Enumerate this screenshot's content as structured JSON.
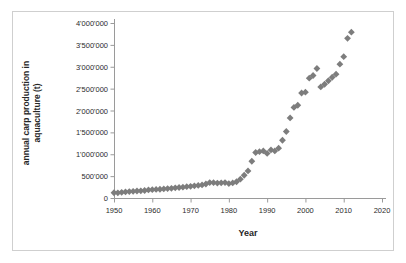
{
  "figure": {
    "background_color": "#ffffff",
    "frame_color": "#cfcfcf",
    "axis_color": "#9a9a9a",
    "marker_color": "#7d7d7d",
    "text_color": "#2b2b2b"
  },
  "chart_data": {
    "type": "scatter",
    "title": "",
    "xlabel": "Year",
    "ylabel": "annual carp production in aquaculture (t)",
    "ylabel_line1": "annual carp production in",
    "ylabel_line2": "aquaculture (t)",
    "xlim": [
      1950,
      2020
    ],
    "ylim": [
      0,
      4000000
    ],
    "grid": false,
    "legend": "none",
    "xticks": [
      1950,
      1960,
      1970,
      1980,
      1990,
      2000,
      2010,
      2020
    ],
    "xtick_labels": [
      "1950",
      "1960",
      "1970",
      "1980",
      "1990",
      "2000",
      "2010",
      "2020"
    ],
    "yticks": [
      0,
      500000,
      1000000,
      1500000,
      2000000,
      2500000,
      3000000,
      3500000,
      4000000
    ],
    "ytick_labels": [
      "0",
      "500'000",
      "1'000'000",
      "1'500'000",
      "2'000'000",
      "2'500'000",
      "3'000'000",
      "3'500'000",
      "4'000'000"
    ],
    "marker": "diamond",
    "marker_size": 3.4,
    "series": [
      {
        "name": "annual carp production in aquaculture",
        "x": [
          1950,
          1951,
          1952,
          1953,
          1954,
          1955,
          1956,
          1957,
          1958,
          1959,
          1960,
          1961,
          1962,
          1963,
          1964,
          1965,
          1966,
          1967,
          1968,
          1969,
          1970,
          1971,
          1972,
          1973,
          1974,
          1975,
          1976,
          1977,
          1978,
          1979,
          1980,
          1981,
          1982,
          1983,
          1984,
          1985,
          1986,
          1987,
          1988,
          1989,
          1990,
          1991,
          1992,
          1993,
          1994,
          1995,
          1996,
          1997,
          1998,
          1999,
          2000,
          2001,
          2002,
          2003,
          2004,
          2005,
          2006,
          2007,
          2008,
          2009,
          2010,
          2011,
          2012
        ],
        "y": [
          120000,
          118000,
          130000,
          140000,
          148000,
          152000,
          160000,
          165000,
          172000,
          185000,
          190000,
          196000,
          200000,
          208000,
          215000,
          222000,
          232000,
          240000,
          248000,
          258000,
          268000,
          278000,
          288000,
          300000,
          320000,
          352000,
          350000,
          342000,
          348000,
          352000,
          330000,
          345000,
          372000,
          430000,
          520000,
          620000,
          840000,
          1040000,
          1060000,
          1075000,
          1020000,
          1100000,
          1075000,
          1140000,
          1320000,
          1520000,
          1830000,
          2070000,
          2120000,
          2400000,
          2420000,
          2740000,
          2800000,
          2960000,
          2540000,
          2600000,
          2680000,
          2760000,
          2830000,
          3060000,
          3230000,
          3650000,
          3790000
        ]
      }
    ]
  }
}
